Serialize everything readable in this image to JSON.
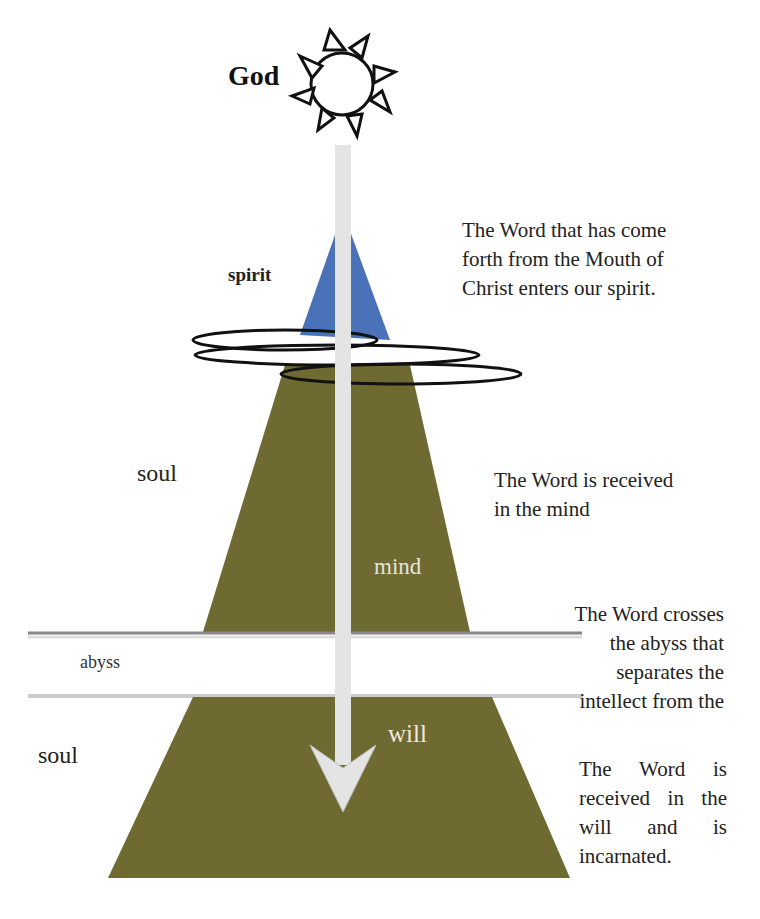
{
  "labels": {
    "god": "God",
    "spirit": "spirit",
    "soul_upper": "soul",
    "soul_lower": "soul",
    "mind": "mind",
    "abyss": "abyss",
    "will": "will"
  },
  "notes": {
    "spirit": [
      "The Word that has come",
      "forth from the Mouth of",
      "Christ enters our spirit."
    ],
    "mind": [
      "The Word is received",
      "in the mind"
    ],
    "abyss": [
      "The Word crosses",
      "the abyss that",
      "separates the",
      "intellect from the"
    ],
    "will": [
      "The Word is",
      "received in the",
      "will and is",
      "incarnated."
    ]
  },
  "icons": {
    "sun": "sun-icon",
    "arrow": "down-arrow"
  },
  "colors": {
    "spirit": "#4a72b8",
    "soul": "#6e6a32",
    "arrow": "#e4e4e4",
    "abyss_line": "#999999"
  }
}
